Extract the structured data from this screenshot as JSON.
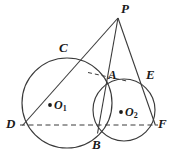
{
  "figure": {
    "type": "geometry-diagram",
    "width": 174,
    "height": 165,
    "stroke_color": "#3a3a3a",
    "label_color": "#1a1a1a",
    "background": "#ffffff"
  },
  "circles": [
    {
      "name": "circle-O1",
      "cx": 67,
      "cy": 103,
      "r": 45,
      "center_label": "O",
      "center_subscript": "1"
    },
    {
      "name": "circle-O2",
      "cx": 124,
      "cy": 110,
      "r": 31,
      "center_label": "O",
      "center_subscript": "2"
    }
  ],
  "points": {
    "P": {
      "label": "P",
      "x": 118,
      "y": 18,
      "label_x": 122,
      "label_y": 4
    },
    "C": {
      "label": "C",
      "x": 70,
      "y": 57,
      "label_x": 60,
      "label_y": 44
    },
    "A": {
      "label": "A",
      "x": 106,
      "y": 83,
      "label_x": 108,
      "label_y": 70
    },
    "E": {
      "label": "E",
      "x": 145,
      "y": 82,
      "label_x": 147,
      "label_y": 70
    },
    "D": {
      "label": "D",
      "x": 23,
      "y": 125,
      "label_x": 8,
      "label_y": 118
    },
    "F": {
      "label": "F",
      "x": 155,
      "y": 125,
      "label_x": 157,
      "label_y": 118
    },
    "B": {
      "label": "B",
      "x": 98,
      "y": 133,
      "label_x": 93,
      "label_y": 139
    }
  },
  "solid_lines": [
    {
      "name": "line-P-D",
      "from": "P",
      "to": "D"
    },
    {
      "name": "line-P-B",
      "from": "P",
      "to": "B"
    },
    {
      "name": "line-P-F",
      "from": "P",
      "to": "F"
    }
  ],
  "dashed_lines": [
    {
      "name": "line-D-F",
      "from": "D",
      "to": "F",
      "note": "horizontal diameter line through both circle centers"
    },
    {
      "name": "tangent-at-A",
      "from_x": 88,
      "from_y": 72,
      "to_x": 128,
      "to_y": 81,
      "note": "short dashed tangent segment through A"
    }
  ],
  "labels": {
    "P": "P",
    "C": "C",
    "A": "A",
    "E": "E",
    "D": "D",
    "F": "F",
    "B": "B",
    "O1": "O",
    "O1_sub": "1",
    "O2": "O",
    "O2_sub": "2"
  }
}
